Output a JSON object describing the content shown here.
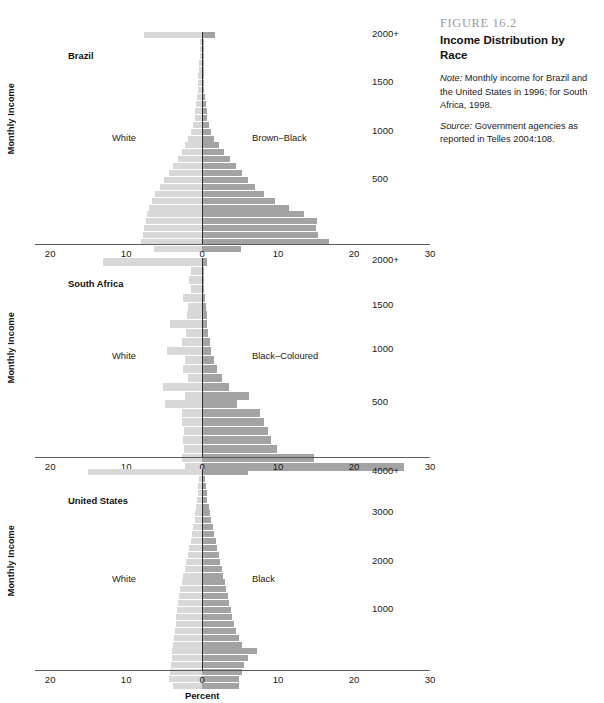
{
  "caption": {
    "figure_number": "FIGURE 16.2",
    "title": "Income Distribution by Race",
    "note_prefix": "Note:",
    "note_text": " Monthly income for Brazil and the United States in 1996; for South Africa, 1998.",
    "source_prefix": "Source:",
    "source_text": " Government agencies as reported in Telles 2004:108."
  },
  "axis": {
    "y_title": "Monthly Income",
    "x_title": "Percent",
    "x_tick_labels": [
      "20",
      "10",
      "0",
      "10",
      "20",
      "30"
    ],
    "x_tick_values": [
      -20,
      -10,
      0,
      10,
      20,
      30
    ],
    "x_min": -22,
    "x_max": 30
  },
  "chart_data": [
    {
      "type": "bar",
      "id": "brazil",
      "title": "Brazil",
      "left_label": "White",
      "right_label": "Brown–Black",
      "xlabel": "",
      "ylabel": "Monthly Income",
      "xlim": [
        -22,
        30
      ],
      "grid": false,
      "left_color": "#d8d8d8",
      "right_color": "#a3a3a3",
      "y_tick_labels": [
        "2000+",
        "1500",
        "1000",
        "500"
      ],
      "y_tick_rows": [
        0,
        7,
        14,
        21
      ],
      "series": [
        {
          "name": "White",
          "side": "left",
          "values": [
            7.6,
            0.3,
            0.3,
            0.3,
            0.4,
            0.4,
            0.5,
            0.5,
            0.6,
            0.7,
            0.8,
            0.9,
            1.0,
            1.2,
            1.5,
            1.8,
            2.2,
            2.7,
            3.2,
            3.8,
            4.4,
            5.0,
            5.6,
            6.2,
            6.6,
            7.0,
            7.2,
            7.4,
            7.6,
            7.8,
            8.0,
            6.3
          ]
        },
        {
          "name": "Brown–Black",
          "side": "right",
          "values": [
            1.7,
            0.2,
            0.2,
            0.2,
            0.2,
            0.2,
            0.3,
            0.3,
            0.3,
            0.4,
            0.5,
            0.6,
            0.7,
            0.9,
            1.2,
            1.6,
            2.2,
            2.9,
            3.7,
            4.5,
            5.3,
            6.1,
            7.0,
            8.2,
            9.6,
            11.5,
            13.4,
            15.1,
            15.0,
            15.3,
            16.7,
            5.1
          ]
        }
      ]
    },
    {
      "type": "bar",
      "id": "south-africa",
      "title": "South Africa",
      "left_label": "White",
      "right_label": "Black–Coloured",
      "xlabel": "",
      "ylabel": "Monthly Income",
      "xlim": [
        -22,
        30
      ],
      "grid": false,
      "left_color": "#d8d8d8",
      "right_color": "#a3a3a3",
      "y_tick_labels": [
        "2000+",
        "1500",
        "1000",
        "500"
      ],
      "y_tick_rows": [
        0,
        5,
        10,
        16
      ],
      "series": [
        {
          "name": "White",
          "side": "left",
          "values": [
            13.0,
            1.5,
            1.7,
            1.4,
            2.5,
            1.8,
            2.0,
            4.2,
            2.1,
            2.6,
            4.6,
            2.3,
            2.5,
            1.8,
            5.1,
            2.3,
            4.9,
            2.6,
            2.7,
            2.4,
            2.5,
            2.4,
            2.6,
            2.3
          ]
        },
        {
          "name": "Black–Coloured",
          "side": "right",
          "values": [
            0.6,
            0.2,
            0.3,
            0.3,
            0.4,
            0.5,
            0.6,
            0.7,
            0.8,
            1.0,
            1.2,
            1.5,
            1.9,
            2.6,
            3.5,
            6.2,
            4.6,
            7.6,
            8.2,
            8.7,
            9.1,
            9.9,
            14.7,
            26.6
          ]
        }
      ]
    },
    {
      "type": "bar",
      "id": "united-states",
      "title": "United States",
      "left_label": "White",
      "right_label": "Black",
      "xlabel": "Percent",
      "ylabel": "Monthly Income",
      "xlim": [
        -22,
        30
      ],
      "grid": false,
      "left_color": "#d8d8d8",
      "right_color": "#a3a3a3",
      "y_tick_labels": [
        "4000+",
        "3000",
        "2000",
        "1000"
      ],
      "y_tick_rows": [
        0,
        6,
        13,
        20
      ],
      "series": [
        {
          "name": "White",
          "side": "left",
          "values": [
            15.0,
            0.4,
            0.5,
            0.6,
            0.7,
            0.8,
            0.9,
            1.0,
            1.2,
            1.3,
            1.5,
            1.7,
            1.9,
            2.1,
            2.3,
            2.5,
            2.7,
            2.9,
            3.0,
            3.2,
            3.3,
            3.4,
            3.5,
            3.6,
            3.7,
            3.8,
            3.9,
            4.0,
            4.1,
            4.2,
            4.3,
            3.8
          ]
        },
        {
          "name": "Black",
          "side": "right",
          "values": [
            6.0,
            0.4,
            0.5,
            0.6,
            0.7,
            0.9,
            1.0,
            1.2,
            1.4,
            1.6,
            1.8,
            2.0,
            2.2,
            2.4,
            2.6,
            2.8,
            3.0,
            3.2,
            3.4,
            3.6,
            3.8,
            4.0,
            4.2,
            4.5,
            4.8,
            5.2,
            7.2,
            6.0,
            5.5,
            5.2,
            4.9,
            4.9
          ]
        }
      ]
    }
  ]
}
